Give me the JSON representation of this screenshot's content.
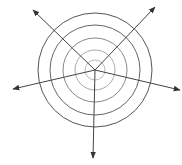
{
  "diagram": {
    "title": "",
    "center": [
      95,
      70
    ],
    "rings": [
      {
        "r": 57,
        "color": "#555555"
      },
      {
        "r": 45,
        "color": "#666666"
      },
      {
        "r": 32,
        "color": "#888888"
      },
      {
        "r": 20,
        "color": "#aaaaaa"
      },
      {
        "r": 10,
        "color": "#bbbbbb"
      }
    ],
    "arrows": [
      {
        "name": "arrow-upper-left",
        "tip": [
          33,
          10
        ]
      },
      {
        "name": "arrow-upper-right",
        "tip": [
          155,
          7
        ]
      },
      {
        "name": "arrow-left",
        "tip": [
          13,
          89
        ]
      },
      {
        "name": "arrow-right",
        "tip": [
          180,
          90
        ]
      },
      {
        "name": "arrow-down",
        "tip": [
          93,
          158
        ]
      }
    ],
    "line_color": "#444444",
    "background": "#ffffff"
  }
}
